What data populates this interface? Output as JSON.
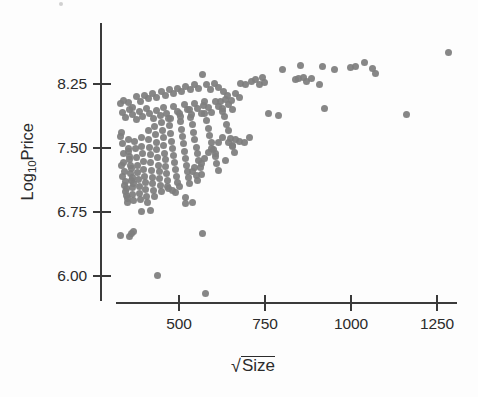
{
  "chart_data": {
    "type": "scatter",
    "title": "",
    "xlabel": "√Size",
    "ylabel": "Log10Price",
    "xlabel_parts": {
      "radical": "√",
      "radicand": "Size"
    },
    "ylabel_parts": {
      "base": "Log",
      "subscript": "10",
      "tail": "Price"
    },
    "xlim": [
      320,
      1300
    ],
    "ylim": [
      5.72,
      8.72
    ],
    "xticks": [
      500,
      750,
      1000,
      1250
    ],
    "xtick_labels": [
      "500",
      "750",
      "1000",
      "1250"
    ],
    "yticks": [
      6.0,
      6.75,
      7.5,
      8.25
    ],
    "ytick_labels": [
      "6.00",
      "6.75",
      "7.50",
      "8.25"
    ],
    "grid": false,
    "legend": null,
    "marker": {
      "shape": "circle",
      "color": "#7e7e7e",
      "size_px": 7
    },
    "n_points": 231,
    "points": [
      [
        333,
        7.68
      ],
      [
        336,
        7.55
      ],
      [
        338,
        7.44
      ],
      [
        340,
        7.33
      ],
      [
        342,
        7.22
      ],
      [
        344,
        7.11
      ],
      [
        346,
        7.02
      ],
      [
        348,
        6.94
      ],
      [
        350,
        6.86
      ],
      [
        352,
        7.6
      ],
      [
        354,
        7.5
      ],
      [
        356,
        7.4
      ],
      [
        358,
        7.3
      ],
      [
        360,
        7.2
      ],
      [
        362,
        7.12
      ],
      [
        364,
        7.04
      ],
      [
        366,
        6.96
      ],
      [
        368,
        6.88
      ],
      [
        331,
        7.63
      ],
      [
        334,
        7.29
      ],
      [
        337,
        7.17
      ],
      [
        341,
        7.06
      ],
      [
        345,
        6.99
      ],
      [
        349,
        6.91
      ],
      [
        353,
        7.46
      ],
      [
        357,
        7.36
      ],
      [
        361,
        7.26
      ],
      [
        365,
        7.16
      ],
      [
        369,
        7.08
      ],
      [
        372,
        7.58
      ],
      [
        374,
        7.49
      ],
      [
        376,
        7.39
      ],
      [
        378,
        7.3
      ],
      [
        380,
        7.21
      ],
      [
        382,
        7.13
      ],
      [
        384,
        7.05
      ],
      [
        386,
        6.97
      ],
      [
        388,
        6.9
      ],
      [
        390,
        7.62
      ],
      [
        392,
        7.52
      ],
      [
        394,
        7.43
      ],
      [
        396,
        7.34
      ],
      [
        398,
        7.25
      ],
      [
        400,
        7.17
      ],
      [
        402,
        7.09
      ],
      [
        404,
        7.01
      ],
      [
        406,
        6.93
      ],
      [
        408,
        6.86
      ],
      [
        410,
        7.7
      ],
      [
        412,
        7.6
      ],
      [
        414,
        7.51
      ],
      [
        416,
        7.42
      ],
      [
        418,
        7.33
      ],
      [
        420,
        7.24
      ],
      [
        422,
        7.16
      ],
      [
        424,
        7.08
      ],
      [
        426,
        7.0
      ],
      [
        428,
        6.93
      ],
      [
        430,
        7.75
      ],
      [
        432,
        7.66
      ],
      [
        434,
        7.57
      ],
      [
        436,
        7.48
      ],
      [
        438,
        7.39
      ],
      [
        440,
        7.3
      ],
      [
        442,
        7.22
      ],
      [
        444,
        7.14
      ],
      [
        446,
        7.06
      ],
      [
        448,
        6.99
      ],
      [
        450,
        7.8
      ],
      [
        452,
        7.71
      ],
      [
        454,
        7.62
      ],
      [
        456,
        7.53
      ],
      [
        458,
        7.44
      ],
      [
        460,
        7.36
      ],
      [
        462,
        7.28
      ],
      [
        464,
        7.2
      ],
      [
        466,
        7.12
      ],
      [
        468,
        7.05
      ],
      [
        470,
        7.85
      ],
      [
        473,
        7.76
      ],
      [
        476,
        7.67
      ],
      [
        479,
        7.58
      ],
      [
        482,
        7.49
      ],
      [
        485,
        7.41
      ],
      [
        488,
        7.33
      ],
      [
        491,
        7.25
      ],
      [
        494,
        7.17
      ],
      [
        497,
        7.1
      ],
      [
        500,
        7.9
      ],
      [
        503,
        7.81
      ],
      [
        506,
        7.72
      ],
      [
        509,
        7.63
      ],
      [
        512,
        7.55
      ],
      [
        515,
        7.46
      ],
      [
        518,
        7.38
      ],
      [
        521,
        7.3
      ],
      [
        524,
        7.22
      ],
      [
        527,
        7.15
      ],
      [
        530,
        7.95
      ],
      [
        534,
        7.86
      ],
      [
        538,
        7.77
      ],
      [
        542,
        7.68
      ],
      [
        546,
        7.6
      ],
      [
        550,
        7.51
      ],
      [
        554,
        7.43
      ],
      [
        558,
        7.35
      ],
      [
        562,
        7.27
      ],
      [
        566,
        7.19
      ],
      [
        570,
        8.0
      ],
      [
        575,
        7.91
      ],
      [
        580,
        7.82
      ],
      [
        585,
        7.73
      ],
      [
        590,
        7.65
      ],
      [
        595,
        7.56
      ],
      [
        600,
        7.48
      ],
      [
        605,
        7.4
      ],
      [
        610,
        7.32
      ],
      [
        615,
        7.24
      ],
      [
        620,
        8.05
      ],
      [
        626,
        7.96
      ],
      [
        632,
        7.87
      ],
      [
        638,
        7.78
      ],
      [
        644,
        7.7
      ],
      [
        650,
        7.61
      ],
      [
        656,
        7.53
      ],
      [
        662,
        7.45
      ],
      [
        330,
        8.02
      ],
      [
        340,
        8.06
      ],
      [
        352,
        8.03
      ],
      [
        364,
        7.98
      ],
      [
        376,
        8.1
      ],
      [
        388,
        8.05
      ],
      [
        400,
        8.12
      ],
      [
        412,
        8.08
      ],
      [
        424,
        8.14
      ],
      [
        436,
        8.09
      ],
      [
        448,
        8.16
      ],
      [
        460,
        8.12
      ],
      [
        472,
        8.18
      ],
      [
        484,
        8.14
      ],
      [
        496,
        8.2
      ],
      [
        508,
        8.16
      ],
      [
        520,
        8.22
      ],
      [
        532,
        8.18
      ],
      [
        544,
        8.25
      ],
      [
        556,
        8.2
      ],
      [
        568,
        8.36
      ],
      [
        580,
        8.24
      ],
      [
        592,
        8.19
      ],
      [
        604,
        8.26
      ],
      [
        616,
        8.21
      ],
      [
        628,
        8.16
      ],
      [
        640,
        8.11
      ],
      [
        652,
        8.06
      ],
      [
        664,
        8.14
      ],
      [
        676,
        8.09
      ],
      [
        335,
        7.92
      ],
      [
        345,
        7.86
      ],
      [
        355,
        7.95
      ],
      [
        365,
        7.89
      ],
      [
        375,
        7.83
      ],
      [
        385,
        7.93
      ],
      [
        395,
        7.87
      ],
      [
        405,
        7.96
      ],
      [
        415,
        7.9
      ],
      [
        425,
        7.84
      ],
      [
        435,
        7.94
      ],
      [
        445,
        7.88
      ],
      [
        455,
        7.97
      ],
      [
        465,
        7.91
      ],
      [
        475,
        7.85
      ],
      [
        485,
        7.99
      ],
      [
        495,
        7.93
      ],
      [
        505,
        7.87
      ],
      [
        515,
        8.01
      ],
      [
        525,
        7.95
      ],
      [
        535,
        7.89
      ],
      [
        545,
        8.02
      ],
      [
        555,
        7.96
      ],
      [
        565,
        7.9
      ],
      [
        575,
        8.04
      ],
      [
        585,
        7.98
      ],
      [
        595,
        7.92
      ],
      [
        605,
        8.05
      ],
      [
        615,
        7.99
      ],
      [
        625,
        7.93
      ],
      [
        635,
        8.07
      ],
      [
        645,
        8.01
      ],
      [
        655,
        7.95
      ],
      [
        470,
        7.03
      ],
      [
        480,
        7.0
      ],
      [
        490,
        6.98
      ],
      [
        500,
        7.05
      ],
      [
        520,
        6.92
      ],
      [
        530,
        7.08
      ],
      [
        540,
        7.22
      ],
      [
        545,
        7.27
      ],
      [
        550,
        7.18
      ],
      [
        555,
        7.12
      ],
      [
        565,
        7.32
      ],
      [
        575,
        7.38
      ],
      [
        585,
        7.45
      ],
      [
        595,
        7.5
      ],
      [
        605,
        7.43
      ],
      [
        615,
        7.56
      ],
      [
        625,
        7.62
      ],
      [
        635,
        7.35
      ],
      [
        645,
        7.57
      ],
      [
        655,
        7.52
      ],
      [
        665,
        7.6
      ],
      [
        675,
        7.58
      ],
      [
        690,
        7.56
      ],
      [
        705,
        7.62
      ],
      [
        330,
        6.48
      ],
      [
        355,
        6.46
      ],
      [
        362,
        6.5
      ],
      [
        368,
        6.52
      ],
      [
        390,
        6.76
      ],
      [
        418,
        6.77
      ],
      [
        438,
        6.01
      ],
      [
        520,
        6.85
      ],
      [
        540,
        6.86
      ],
      [
        568,
        6.5
      ],
      [
        578,
        5.8
      ],
      [
        680,
        8.26
      ],
      [
        692,
        8.25
      ],
      [
        712,
        8.28
      ],
      [
        722,
        8.3
      ],
      [
        735,
        8.24
      ],
      [
        742,
        8.33
      ],
      [
        748,
        8.27
      ],
      [
        760,
        7.9
      ],
      [
        790,
        7.88
      ],
      [
        800,
        8.42
      ],
      [
        852,
        8.47
      ],
      [
        838,
        8.3
      ],
      [
        848,
        8.32
      ],
      [
        862,
        8.33
      ],
      [
        872,
        8.28
      ],
      [
        886,
        8.31
      ],
      [
        908,
        8.24
      ],
      [
        918,
        8.45
      ],
      [
        922,
        7.96
      ],
      [
        952,
        8.42
      ],
      [
        998,
        8.44
      ],
      [
        1012,
        8.45
      ],
      [
        1040,
        8.5
      ],
      [
        1062,
        8.43
      ],
      [
        1072,
        8.37
      ],
      [
        1160,
        7.89
      ],
      [
        1282,
        8.62
      ]
    ]
  },
  "axis": {
    "y_title_display": "Log10Price",
    "x_title_display": "√Size"
  }
}
